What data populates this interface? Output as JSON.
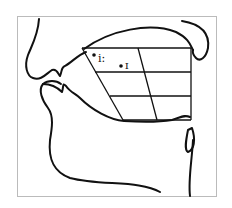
{
  "diagram": {
    "type": "vowel-chart-sagittal-section",
    "vowels": [
      {
        "symbol": "i:",
        "x": 92,
        "y": 55
      },
      {
        "symbol": "ɪ",
        "x": 121,
        "y": 66
      }
    ],
    "colors": {
      "stroke": "#111111",
      "frame": "#bbbbbb",
      "background": "#ffffff"
    }
  }
}
